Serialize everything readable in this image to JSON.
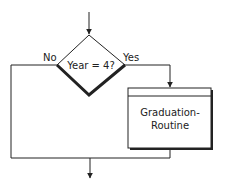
{
  "flowchart": {
    "decision": {
      "text": "Year = 4?"
    },
    "branches": {
      "no_label": "No",
      "yes_label": "Yes"
    },
    "process": {
      "line1": "Graduation-",
      "line2": "Routine"
    }
  },
  "colors": {
    "stroke": "#222222",
    "background": "#ffffff"
  }
}
